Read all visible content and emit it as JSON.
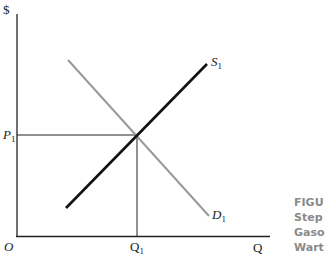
{
  "axes": {
    "y_label": "$",
    "x_label": "Q",
    "origin_label": "O"
  },
  "labels": {
    "price_equilibrium": "P",
    "price_equilibrium_sub": "1",
    "quantity_equilibrium": "Q",
    "quantity_equilibrium_sub": "1",
    "supply": "S",
    "supply_sub": "1",
    "demand": "D",
    "demand_sub": "1"
  },
  "curves": {
    "supply": {
      "color": "#111111",
      "from": [
        66,
        208
      ],
      "to": [
        207,
        64
      ]
    },
    "demand": {
      "color": "#999999",
      "from": [
        68,
        60
      ],
      "to": [
        209,
        216
      ]
    },
    "equilibrium_point": [
      137,
      135
    ]
  },
  "caption_fragments": [
    "FIGU",
    "Step ",
    "Gaso",
    "Wart"
  ]
}
